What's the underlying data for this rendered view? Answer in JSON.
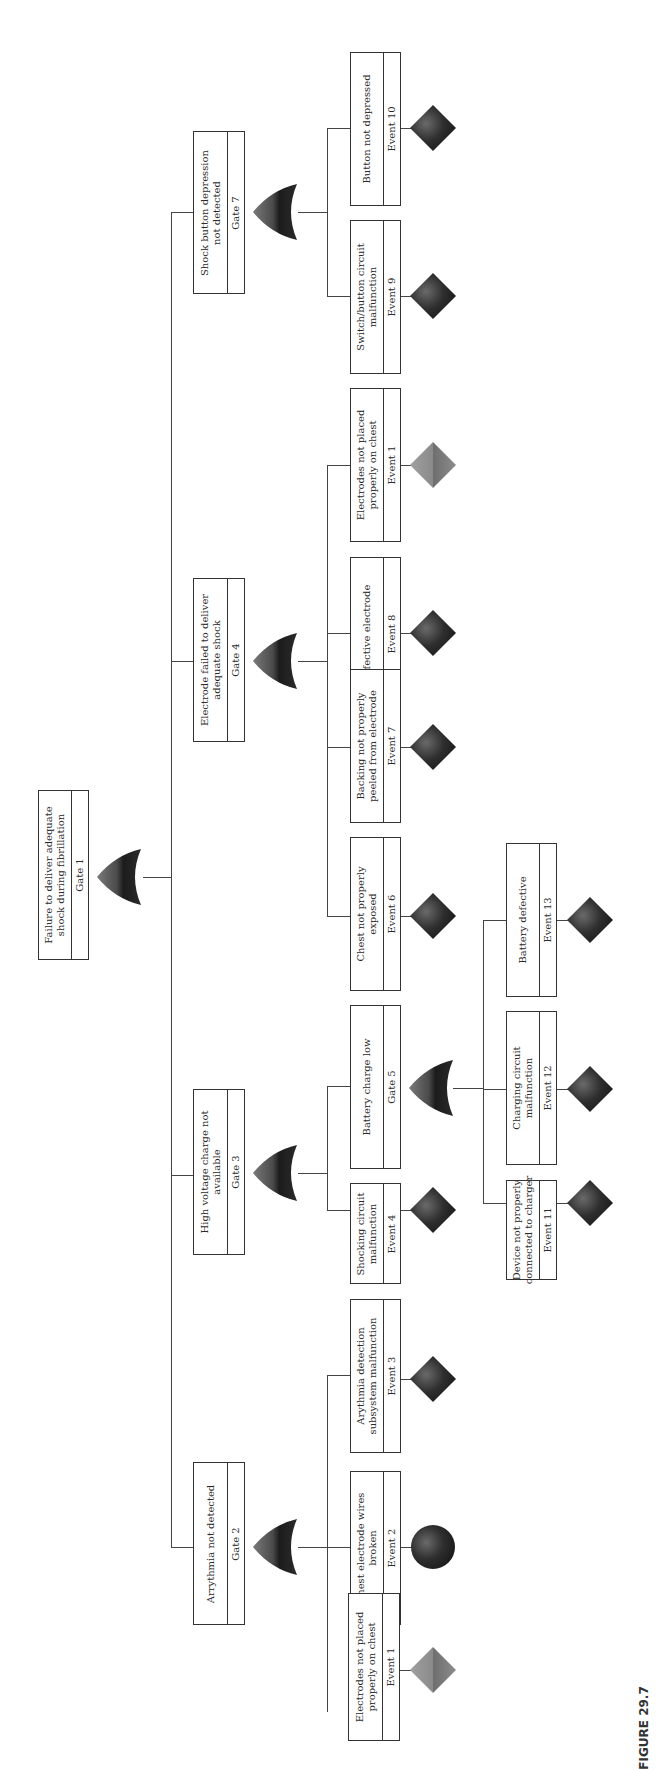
{
  "figure": {
    "caption": "FIGURE 29.7",
    "orientation": "rotated 90° counter-clockwise (root on left, leaves on right)"
  },
  "colors": {
    "line": "#444444",
    "box_border": "#333333",
    "basic_event_fill": "#2b2b2b",
    "undeveloped_light_fill": "#8a8a8a",
    "gate_fill": "#333333"
  },
  "gates": {
    "g1": {
      "label": "Failure to deliver adequate shock during fibrillation",
      "line1": "Failure to deliver adequate",
      "line2": "shock during fibrillation",
      "id": "Gate 1",
      "type": "OR"
    },
    "g2": {
      "label": "Arrythmia not detected",
      "line1": "Arrythmia not detected",
      "line2": "",
      "id": "Gate 2",
      "type": "OR"
    },
    "g3": {
      "label": "High voltage charge not available",
      "line1": "High voltage charge not",
      "line2": "available",
      "id": "Gate 3",
      "type": "OR"
    },
    "g4": {
      "label": "Electrode failed to deliver adequate shock",
      "line1": "Electrode failed to deliver",
      "line2": "adequate shock",
      "id": "Gate 4",
      "type": "OR"
    },
    "g5": {
      "label": "Battery charge low",
      "line1": "Battery charge low",
      "line2": "",
      "id": "Gate 5",
      "type": "OR"
    },
    "g7": {
      "label": "Shock button depression not detected",
      "line1": "Shock button depression",
      "line2": "not detected",
      "id": "Gate 7",
      "type": "OR"
    }
  },
  "events": {
    "e1a": {
      "line1": "Electrodes not placed",
      "line2": "properly on chest",
      "id": "Event 1",
      "symbol": "diamond-light"
    },
    "e2": {
      "line1": "Chest electrode wires",
      "line2": "broken",
      "id": "Event 2",
      "symbol": "circle"
    },
    "e3": {
      "line1": "Arythmia detection",
      "line2": "subsystem malfunction",
      "id": "Event 3",
      "symbol": "diamond"
    },
    "e4": {
      "line1": "Shocking circuit",
      "line2": "malfunction",
      "id": "Event 4",
      "symbol": "diamond"
    },
    "e6": {
      "line1": "Chest not properly",
      "line2": "exposed",
      "id": "Event 6",
      "symbol": "diamond"
    },
    "e7": {
      "line1": "Backing not properly",
      "line2": "peeled from electrode",
      "id": "Event 7",
      "symbol": "diamond"
    },
    "e8": {
      "line1": "Defective electrode",
      "line2": "",
      "id": "Event 8",
      "symbol": "diamond"
    },
    "e1b": {
      "line1": "Electrodes not placed",
      "line2": "properly on chest",
      "id": "Event 1",
      "symbol": "diamond-light"
    },
    "e9": {
      "line1": "Switch/button circuit",
      "line2": "malfunction",
      "id": "Event 9",
      "symbol": "diamond"
    },
    "e10": {
      "line1": "Button not depressed",
      "line2": "",
      "id": "Event 10",
      "symbol": "diamond"
    },
    "e11": {
      "line1": "Device not properly",
      "line2": "connected to charger",
      "id": "Event 11",
      "symbol": "diamond"
    },
    "e12": {
      "line1": "Charging circuit",
      "line2": "malfunction",
      "id": "Event 12",
      "symbol": "diamond"
    },
    "e13": {
      "line1": "Battery defective",
      "line2": "",
      "id": "Event 13",
      "symbol": "diamond"
    }
  },
  "tree": {
    "Gate 1": [
      "Gate 2",
      "Gate 3",
      "Gate 4",
      "Gate 7"
    ],
    "Gate 2": [
      "Event 1",
      "Event 2",
      "Event 3"
    ],
    "Gate 3": [
      "Event 4",
      "Gate 5"
    ],
    "Gate 5": [
      "Event 11",
      "Event 12",
      "Event 13"
    ],
    "Gate 4": [
      "Event 6",
      "Event 7",
      "Event 8",
      "Event 1"
    ],
    "Gate 7": [
      "Event 9",
      "Event 10"
    ]
  }
}
